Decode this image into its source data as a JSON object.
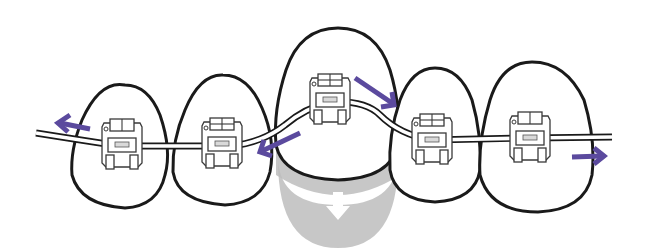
{
  "figure": {
    "title": "Braces moving an extruded tooth down into alignment",
    "colors": {
      "outline": "#1a1a1a",
      "arrow": "#5b4a9e",
      "shadow": "#bdbdbd",
      "background": "#ffffff"
    },
    "teeth": [
      {
        "id": "tooth-1",
        "label": "left tooth"
      },
      {
        "id": "tooth-2",
        "label": "left-center tooth"
      },
      {
        "id": "tooth-3",
        "label": "center raised tooth"
      },
      {
        "id": "tooth-4",
        "label": "right-center tooth"
      },
      {
        "id": "tooth-5",
        "label": "right tooth"
      }
    ],
    "arrows": [
      {
        "id": "arrow-left-outward",
        "direction": "left"
      },
      {
        "id": "arrow-center-left-inward",
        "direction": "down-left"
      },
      {
        "id": "arrow-center-right-inward",
        "direction": "down-right"
      },
      {
        "id": "arrow-right-outward",
        "direction": "right"
      },
      {
        "id": "arrow-down-target",
        "direction": "down",
        "icon": "down-arrow-icon"
      }
    ],
    "brackets_count": 5,
    "wire": "archwire"
  }
}
